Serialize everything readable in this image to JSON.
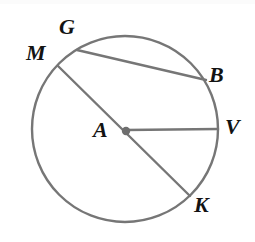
{
  "figure": {
    "kind": "circle-geometry-diagram",
    "background_color": "#ffffff",
    "stroke_color": "#767676",
    "center_dot_color": "#6e6e6e",
    "label_color": "#131313",
    "canvas": {
      "width": 255,
      "height": 242
    }
  },
  "circle": {
    "name": "circle-A",
    "center": {
      "x": 125,
      "y": 129
    },
    "radius": 93,
    "stroke_width": 2.4
  },
  "center_point": {
    "label": "A",
    "x": 126,
    "y": 131,
    "dot_radius": 4.2
  },
  "points": {
    "M": {
      "label": "M",
      "x": 58,
      "y": 66
    },
    "G": {
      "label": "G",
      "x": 77,
      "y": 50
    },
    "B": {
      "label": "B",
      "x": 206,
      "y": 80
    },
    "V": {
      "label": "V",
      "x": 218,
      "y": 129
    },
    "K": {
      "label": "K",
      "x": 190,
      "y": 196
    },
    "A": {
      "label": "A",
      "x": 126,
      "y": 131
    }
  },
  "segments": [
    {
      "name": "diameter-MK",
      "from": "M",
      "to": "K",
      "x1": 58,
      "y1": 66,
      "x2": 190,
      "y2": 196,
      "type": "diameter",
      "stroke_width": 2.4
    },
    {
      "name": "chord-GB",
      "from": "G",
      "to": "B",
      "x1": 77,
      "y1": 50,
      "x2": 206,
      "y2": 80,
      "type": "chord",
      "stroke_width": 2.4
    },
    {
      "name": "radius-AV",
      "from": "A",
      "to": "V",
      "x1": 126,
      "y1": 130,
      "x2": 218,
      "y2": 129,
      "type": "radius",
      "stroke_width": 2.4
    }
  ],
  "labels": {
    "M": {
      "text": "M",
      "left": 26,
      "top": 42,
      "font_size": 22
    },
    "G": {
      "text": "G",
      "left": 59,
      "top": 16,
      "font_size": 22
    },
    "B": {
      "text": "B",
      "left": 209,
      "top": 64,
      "font_size": 22
    },
    "V": {
      "text": "V",
      "left": 225,
      "top": 116,
      "font_size": 22
    },
    "K": {
      "text": "K",
      "left": 194,
      "top": 194,
      "font_size": 22
    },
    "A": {
      "text": "A",
      "left": 93,
      "top": 119,
      "font_size": 22
    }
  }
}
